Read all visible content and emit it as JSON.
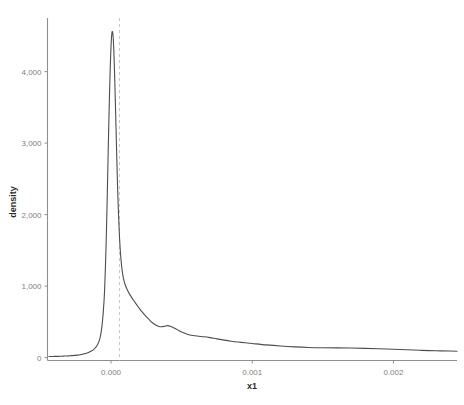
{
  "chart_data": {
    "type": "line",
    "title": "",
    "subtitle": "",
    "xlabel": "x1",
    "ylabel": "density",
    "xlim": [
      -0.00045,
      0.00245
    ],
    "ylim": [
      -40,
      4750
    ],
    "grid": false,
    "legend": null,
    "x_ticks": [
      {
        "value": 0.0,
        "label": "0.000"
      },
      {
        "value": 0.001,
        "label": "0.001"
      },
      {
        "value": 0.002,
        "label": "0.002"
      }
    ],
    "y_ticks": [
      {
        "value": 0,
        "label": "0"
      },
      {
        "value": 1000,
        "label": "1,000"
      },
      {
        "value": 2000,
        "label": "2,000"
      },
      {
        "value": 3000,
        "label": "3,000"
      },
      {
        "value": 4000,
        "label": "4,000"
      }
    ],
    "annotations": [
      {
        "name": "vertical-reference-line",
        "type": "vline",
        "x": 6e-05,
        "style": "dashed",
        "color": "#c8c8c8"
      }
    ],
    "series": [
      {
        "name": "density",
        "color": "#4d4d4d",
        "x": [
          -0.00044,
          -0.00042,
          -0.0004,
          -0.00038,
          -0.00036,
          -0.00034,
          -0.00032,
          -0.0003,
          -0.00028,
          -0.00026,
          -0.00024,
          -0.00022,
          -0.0002,
          -0.00018,
          -0.00016,
          -0.00014,
          -0.00012,
          -0.0001,
          -8e-05,
          -7e-05,
          -6e-05,
          -5e-05,
          -4.5e-05,
          -4e-05,
          -3.5e-05,
          -3e-05,
          -2.5e-05,
          -2e-05,
          -1.5e-05,
          -1e-05,
          -5e-06,
          0.0,
          5e-06,
          1e-05,
          1.5e-05,
          2e-05,
          2.5e-05,
          3e-05,
          3.5e-05,
          4e-05,
          4.5e-05,
          5e-05,
          6e-05,
          7e-05,
          8e-05,
          9e-05,
          0.0001,
          0.00012,
          0.00014,
          0.00016,
          0.00018,
          0.0002,
          0.00022,
          0.00024,
          0.00026,
          0.00028,
          0.0003,
          0.00032,
          0.00034,
          0.00036,
          0.00038,
          0.0004,
          0.00042,
          0.00044,
          0.00046,
          0.00048,
          0.0005,
          0.00054,
          0.00058,
          0.00062,
          0.00066,
          0.0007,
          0.00075,
          0.0008,
          0.00085,
          0.0009,
          0.00095,
          0.001,
          0.0011,
          0.0012,
          0.0013,
          0.0014,
          0.0015,
          0.0016,
          0.0017,
          0.0018,
          0.0019,
          0.002,
          0.0021,
          0.0022,
          0.0023,
          0.0024,
          0.00245
        ],
        "y": [
          15,
          16,
          17,
          18,
          19,
          21,
          23,
          25,
          28,
          31,
          35,
          40,
          48,
          58,
          72,
          92,
          120,
          165,
          260,
          360,
          520,
          780,
          980,
          1250,
          1580,
          1980,
          2430,
          2900,
          3350,
          3750,
          4100,
          4360,
          4520,
          4560,
          4480,
          4280,
          3980,
          3620,
          3230,
          2840,
          2480,
          2160,
          1680,
          1380,
          1200,
          1090,
          1020,
          930,
          860,
          800,
          745,
          690,
          640,
          595,
          552,
          512,
          478,
          452,
          436,
          432,
          440,
          448,
          440,
          422,
          400,
          378,
          358,
          328,
          310,
          300,
          292,
          280,
          262,
          245,
          230,
          218,
          208,
          198,
          178,
          162,
          150,
          142,
          138,
          136,
          134,
          130,
          124,
          118,
          110,
          102,
          96,
          92,
          90
        ]
      }
    ]
  },
  "axes": {
    "x_title": "x1",
    "y_title": "density"
  }
}
